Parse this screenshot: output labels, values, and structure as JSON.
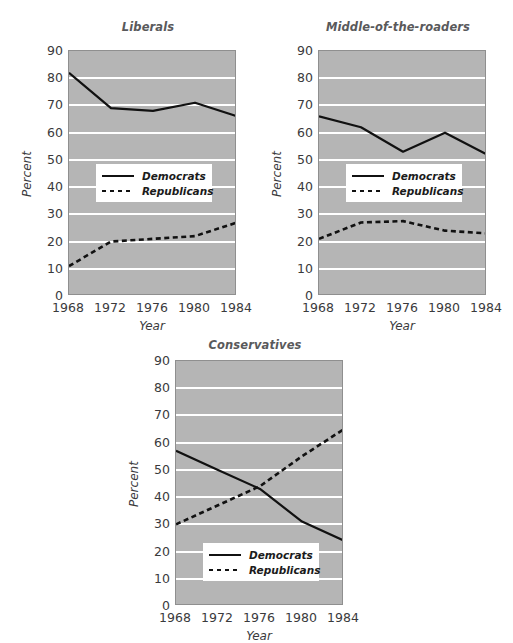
{
  "figure": {
    "axis_label_x": "Year",
    "axis_label_y": "Percent",
    "legend": {
      "democrats": "Democrats",
      "republicans": "Republicans"
    },
    "colors": {
      "plot_background": "#b5b5b5",
      "gridline": "#ffffff",
      "line": "#111111",
      "text": "#3a3a3c",
      "title": "#59595b"
    }
  },
  "chart_data": [
    {
      "type": "line",
      "title": "Liberals",
      "xlabel": "Year",
      "ylabel": "Percent",
      "x": [
        1968,
        1972,
        1976,
        1980,
        1984
      ],
      "xtick_labels": [
        "1968",
        "1972",
        "1976",
        "1980",
        "1984"
      ],
      "ytick_labels": [
        "0",
        "10",
        "20",
        "30",
        "40",
        "50",
        "60",
        "70",
        "80",
        "90"
      ],
      "ylim": [
        0,
        90
      ],
      "xlim": [
        1968,
        1984
      ],
      "grid": true,
      "legend_position": "center-left",
      "series": [
        {
          "name": "Democrats",
          "style": "solid",
          "values": [
            82,
            69,
            68,
            71,
            66
          ]
        },
        {
          "name": "Republicans",
          "style": "dashed",
          "values": [
            11,
            20,
            21,
            22,
            27
          ]
        }
      ]
    },
    {
      "type": "line",
      "title": "Middle-of-the-roaders",
      "xlabel": "Year",
      "ylabel": "Percent",
      "x": [
        1968,
        1972,
        1976,
        1980,
        1984
      ],
      "xtick_labels": [
        "1968",
        "1972",
        "1976",
        "1980",
        "1984"
      ],
      "ytick_labels": [
        "0",
        "10",
        "20",
        "30",
        "40",
        "50",
        "60",
        "70",
        "80",
        "90"
      ],
      "ylim": [
        0,
        90
      ],
      "xlim": [
        1968,
        1984
      ],
      "grid": true,
      "legend_position": "center-left",
      "series": [
        {
          "name": "Democrats",
          "style": "solid",
          "values": [
            66,
            62,
            53,
            60,
            52
          ]
        },
        {
          "name": "Republicans",
          "style": "dashed",
          "values": [
            21,
            27,
            27.5,
            24,
            23
          ]
        }
      ]
    },
    {
      "type": "line",
      "title": "Conservatives",
      "xlabel": "Year",
      "ylabel": "Percent",
      "x": [
        1968,
        1972,
        1976,
        1980,
        1984
      ],
      "xtick_labels": [
        "1968",
        "1972",
        "1976",
        "1980",
        "1984"
      ],
      "ytick_labels": [
        "0",
        "10",
        "20",
        "30",
        "40",
        "50",
        "60",
        "70",
        "80",
        "90"
      ],
      "ylim": [
        0,
        90
      ],
      "xlim": [
        1968,
        1984
      ],
      "grid": true,
      "legend_position": "bottom-center",
      "series": [
        {
          "name": "Democrats",
          "style": "solid",
          "values": [
            57,
            50,
            43,
            31,
            24
          ]
        },
        {
          "name": "Republicans",
          "style": "dashed",
          "values": [
            30,
            37,
            44,
            55,
            65
          ]
        }
      ]
    }
  ]
}
